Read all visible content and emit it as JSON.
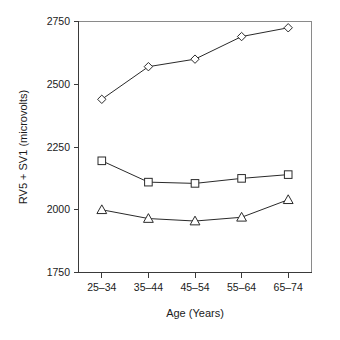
{
  "chart_data": {
    "type": "line",
    "title": "",
    "xlabel": "Age (Years)",
    "ylabel": "RV5 + SV1 (microvolts)",
    "categories": [
      "25–34",
      "35–44",
      "45–54",
      "55–64",
      "65–74"
    ],
    "ylim": [
      1750,
      2750
    ],
    "yticks": [
      1750,
      2000,
      2250,
      2500,
      2750
    ],
    "ytick_labels": [
      "1750",
      "2000",
      "2250",
      "2500",
      "2750"
    ],
    "grid": false,
    "legend": "none",
    "series": [
      {
        "name": "diamond-series",
        "marker": "diamond",
        "values": [
          2440,
          2570,
          2600,
          2690,
          2725
        ]
      },
      {
        "name": "square-series",
        "marker": "square",
        "values": [
          2195,
          2110,
          2105,
          2125,
          2140
        ]
      },
      {
        "name": "triangle-series",
        "marker": "triangle",
        "values": [
          2000,
          1965,
          1955,
          1970,
          2040
        ]
      }
    ],
    "colors": {
      "line": "#2a2a2a",
      "marker_fill": "#ffffff",
      "frame": "#8a8a8a",
      "text": "#1a1a1a"
    }
  }
}
